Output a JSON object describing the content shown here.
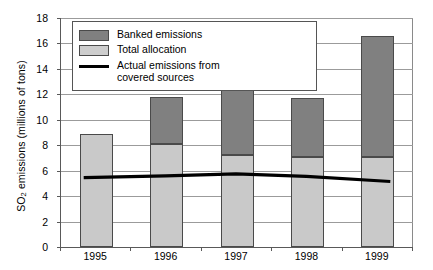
{
  "chart_data": {
    "type": "bar",
    "subtype": "stacked-bar-with-line-overlay",
    "title": "",
    "subtitle": "",
    "xlabel": "",
    "ylabel": "SO2 emissions (millions of tons)",
    "ylabel_parts": {
      "prefix": "SO",
      "subscript": "2",
      "suffix": " emissions (millions of tons)"
    },
    "categories": [
      "1995",
      "1996",
      "1997",
      "1998",
      "1999"
    ],
    "ylim": [
      0,
      18
    ],
    "yticks": [
      0,
      2,
      4,
      6,
      8,
      10,
      12,
      14,
      16,
      18
    ],
    "ytick_labels": [
      "0",
      "2",
      "4",
      "6",
      "8",
      "10",
      "12",
      "14",
      "16",
      "18"
    ],
    "grid": true,
    "grid_axis": "y",
    "legend_position": "top-left-inside",
    "series": [
      {
        "name": "Total allocation",
        "type": "bar",
        "stack_order": 1,
        "color": "#c9c9c9",
        "values": [
          8.85,
          8.1,
          7.25,
          7.1,
          7.05
        ]
      },
      {
        "name": "Banked emissions",
        "type": "bar",
        "stack_order": 2,
        "color": "#808080",
        "values": [
          0,
          3.7,
          6.25,
          4.6,
          9.55
        ]
      },
      {
        "name": "Actual emissions from covered sources",
        "type": "line",
        "color": "#000000",
        "values": [
          5.45,
          5.6,
          5.75,
          5.55,
          5.15
        ]
      }
    ],
    "bar_totals": [
      8.85,
      11.8,
      13.5,
      11.7,
      16.6
    ]
  },
  "legend": {
    "items": [
      {
        "label": "Banked emissions",
        "key": "swatch-dark-gray"
      },
      {
        "label": "Total allocation",
        "key": "swatch-light-gray"
      },
      {
        "label": "Actual emissions from\ncovered sources",
        "key": "line-black"
      }
    ]
  },
  "colors": {
    "banked": "#808080",
    "allocation": "#c9c9c9",
    "line": "#000000",
    "gridline": "#9b9b9b",
    "axis": "#595959",
    "background": "#ffffff"
  }
}
